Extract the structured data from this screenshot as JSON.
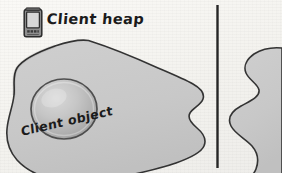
{
  "figure": {
    "kind": "hand-drawn-memory-diagram",
    "background_color": "#f6f5f1",
    "ink_color": "#2e2e2e"
  },
  "labels": {
    "client_heap": "Client heap",
    "client_object": "Client object"
  },
  "icons": {
    "device": "pda-device-icon"
  },
  "shapes": {
    "left_heap": {
      "name": "client-heap-blob",
      "fill": "#c9c9c9",
      "stroke": "#333333"
    },
    "client_object": {
      "name": "client-object-sphere",
      "fill": "#bdbdbd",
      "stroke": "#4a4a4a"
    },
    "right_heap": {
      "name": "server-heap-blob",
      "fill": "#c9c9c9",
      "stroke": "#333333"
    },
    "divider": {
      "name": "panel-divider",
      "color": "#262626"
    }
  }
}
